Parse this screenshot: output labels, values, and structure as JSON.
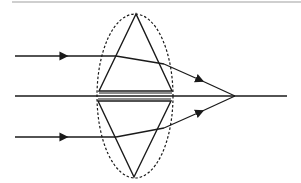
{
  "diagram": {
    "title": "Lens as combination of prisms",
    "colors": {
      "stroke": "#1a1a1a",
      "background": "#ffffff",
      "top_rule": "#cfcfcf"
    },
    "optical_axis": {
      "y": 96,
      "x_start": 15,
      "x_end": 287
    },
    "focal_point": {
      "x": 235,
      "y": 96
    },
    "lens_outline": {
      "style": "dashed",
      "cx": 135,
      "cy": 96,
      "rx": 38,
      "ry": 82
    },
    "upper_prism": {
      "apex": [
        136,
        14
      ],
      "base_left": [
        99,
        91
      ],
      "base_right": [
        172,
        91
      ]
    },
    "lower_prism": {
      "apex": [
        134,
        177
      ],
      "base_left": [
        98,
        101
      ],
      "base_right": [
        171,
        101
      ]
    },
    "rays": [
      {
        "label": "upper ray",
        "y_in": 56,
        "x_start": 15,
        "refract_x": 116,
        "exit_x": 164,
        "exit_y": 66,
        "arrow_in_x": 62
      },
      {
        "label": "lower ray",
        "y_in": 137,
        "x_start": 15,
        "refract_x": 116,
        "exit_x": 164,
        "exit_y": 126,
        "arrow_in_x": 62
      }
    ]
  }
}
